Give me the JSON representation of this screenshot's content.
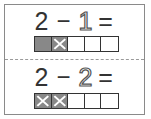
{
  "problems": [
    {
      "minuend": "2",
      "operator": "−",
      "subtrahend": "1",
      "equals": "=",
      "subtrahend_style": "outlined",
      "cells": [
        "filled",
        "crossed",
        "empty",
        "empty",
        "empty"
      ]
    },
    {
      "minuend": "2",
      "operator": "−",
      "subtrahend": "2",
      "equals": "=",
      "subtrahend_style": "outlined",
      "cells": [
        "crossed",
        "crossed",
        "empty",
        "empty",
        "empty"
      ]
    }
  ],
  "colors": {
    "filled": "#888888",
    "cross": "#ffffff",
    "border": "#333333",
    "card_border": "#8a8a8a"
  }
}
